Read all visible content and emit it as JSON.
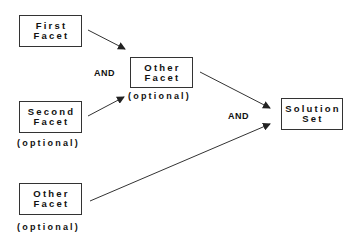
{
  "diagram": {
    "nodes": [
      {
        "id": "first",
        "lines": [
          "First",
          "Facet"
        ],
        "note": ""
      },
      {
        "id": "other_mid",
        "lines": [
          "Other",
          "Facet"
        ],
        "note": "(optional)"
      },
      {
        "id": "second",
        "lines": [
          "Second",
          "Facet"
        ],
        "note": "(optional)"
      },
      {
        "id": "other_bottom",
        "lines": [
          "Other",
          "Facet"
        ],
        "note": "(optional)"
      },
      {
        "id": "solution",
        "lines": [
          "Solution",
          "Set"
        ],
        "note": ""
      }
    ],
    "edges": [
      {
        "from": "first",
        "to": "other_mid"
      },
      {
        "from": "second",
        "to": "other_mid"
      },
      {
        "from": "other_mid",
        "to": "solution"
      },
      {
        "from": "other_bottom",
        "to": "solution"
      }
    ],
    "operators": [
      "AND",
      "AND"
    ],
    "colors": {
      "line": "#333333",
      "text": "#111111",
      "background": "#ffffff"
    }
  }
}
